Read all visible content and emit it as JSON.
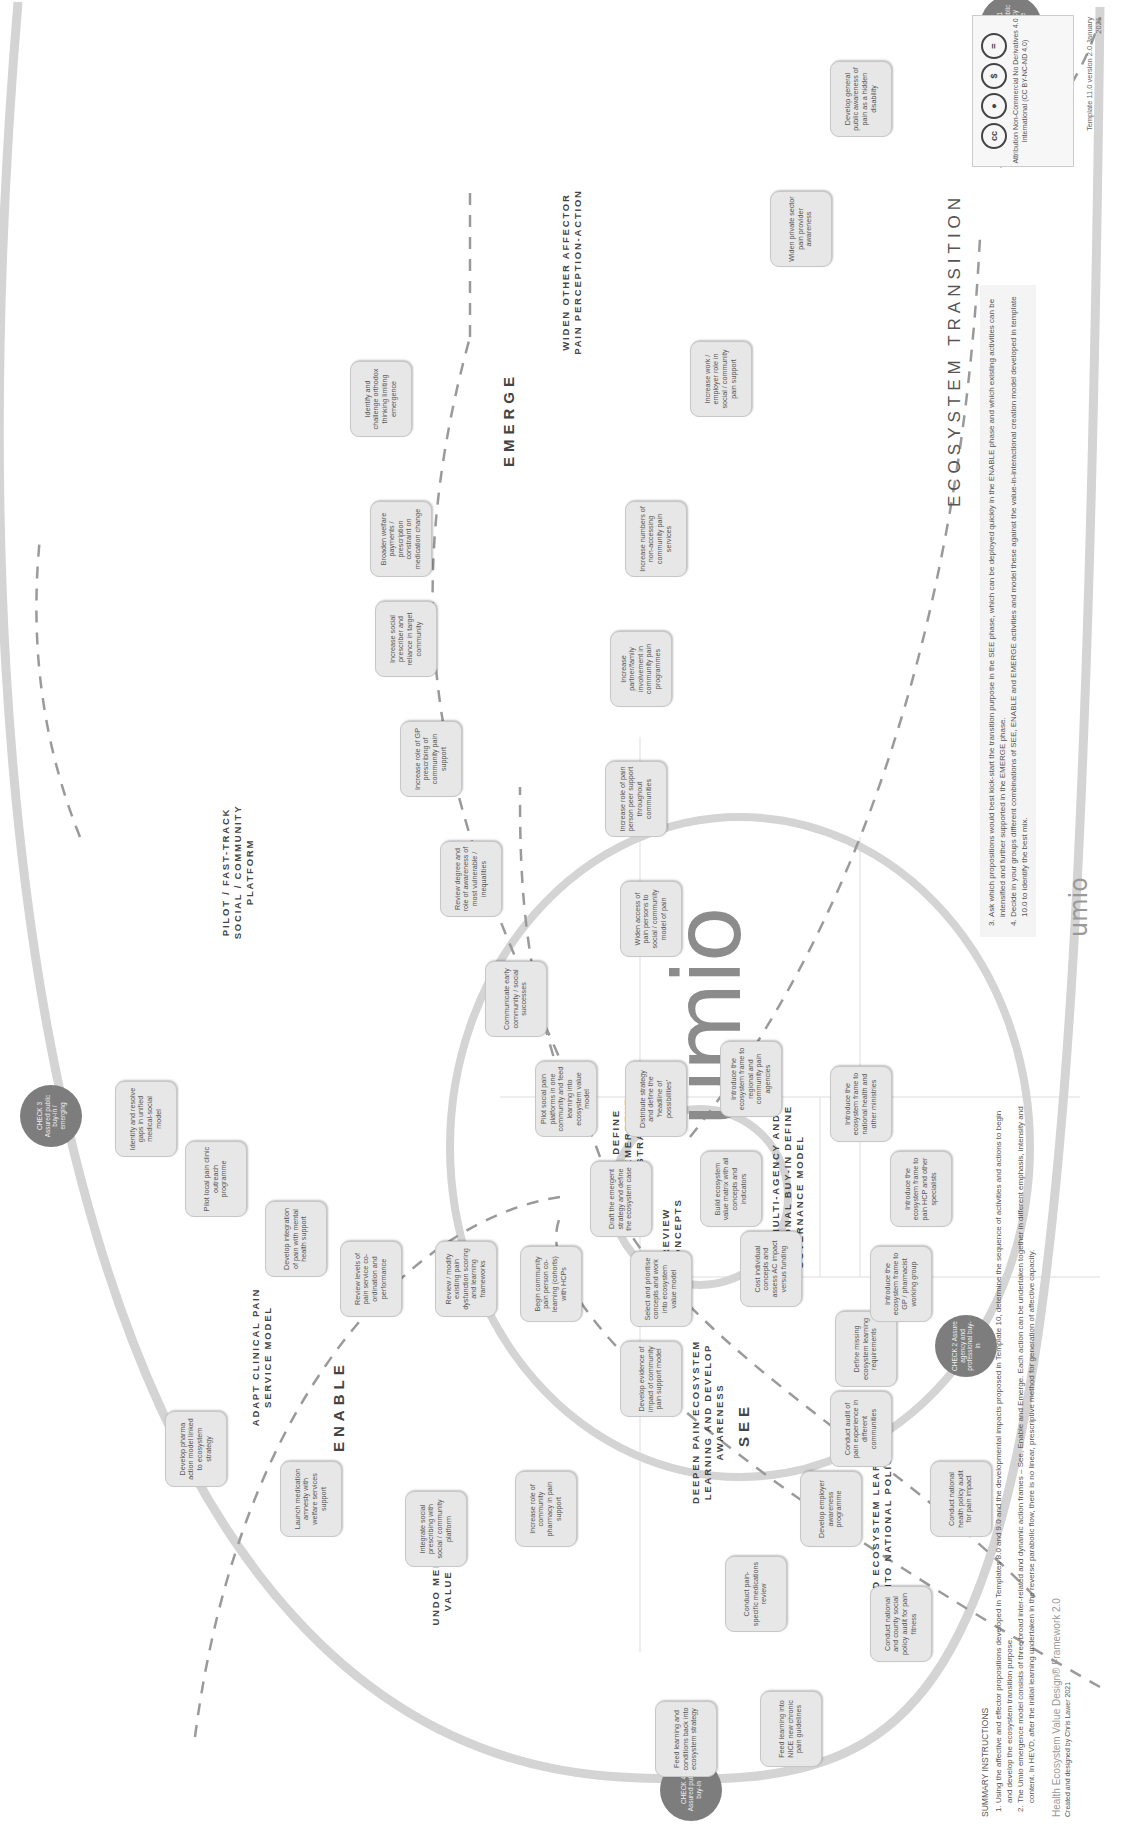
{
  "title": "ECOSYSTEM TRANSITION",
  "logo": "umio",
  "phases": {
    "see": "SEE",
    "enable": "ENABLE",
    "emerge": "EMERGE"
  },
  "sections": {
    "deepen": "DEEPEN PAIN ECOSYSTEM LEARNING AND DEVELOP AWARENESS",
    "feed": "FEED ECOSYSTEM LEARNING INTO NATIONAL POLICY",
    "undo": "UNDO MEDICATION VALUE MODEL",
    "adapt": "ADAPT CLINICAL PAIN SERVICE MODEL",
    "pilot": "PILOT / FAST-TRACK SOCIAL / COMMUNITY PLATFORM",
    "widen": "WIDEN OTHER AFFECTOR PAIN PERCEPTION-ACTION",
    "review": "REVIEW CONCEPTS",
    "define": "DEFINE EMERGENT STRATEGY",
    "create": "CREATE MULTI-AGENCY AND PROFESSIONAL BUY-IN DEFINE GOVERNANCE MODEL"
  },
  "checks": [
    {
      "id": "check-see",
      "label": "CHECK 4 Assured public buy-in"
    },
    {
      "id": "check-enable",
      "label": "CHECK 3 Assured public buy-in / emerging"
    },
    {
      "id": "check-agency",
      "label": "CHECK 2 Assure agency and professional buy-in"
    },
    {
      "id": "check-emerge",
      "label": "CHECK 1 Assured public emergency response"
    }
  ],
  "nodes": {
    "see_outer": [
      "Feed learning into NICE new chronic pain guidelines",
      "Conduct national and county social policy audit for pain fitness",
      "Conduct national health policy audit for pain impact"
    ],
    "see_inner": [
      "Feed learning and conditions back into ecosystem strategy",
      "Conduct pain-specific medications review",
      "Develop employer awareness programme",
      "Conduct audit of pain experience in different communities",
      "Define missing ecosystem learning requirements"
    ],
    "enable_a": [
      "Develop pharma action model linked to ecosystem strategy",
      "Launch medication amnesty with welfare services support"
    ],
    "enable_b": [
      "Integrate social prescribing with social / community platform",
      "Increase role of community pharmacy in pain support",
      "Develop evidence of impact of community pain support model"
    ],
    "adapt": [
      "Identify and resolve gaps in unified medical-social model",
      "Pilot local pain clinic outreach programme",
      "Develop integration of pain with mental health support",
      "Review levels of pain service co-ordination and performance",
      "Review / modify existing pain dysfunction scoring and learning frameworks",
      "Begin community pain person co-learning (cohorts) with HCPs"
    ],
    "pilot": [
      "Pilot social pain platforms in one community and feed learning into ecosystem value model",
      "Communicate early community / social successes",
      "Review degree and role of awareness of most vulnerable / inequalities",
      "Increase role of GP prescribing of community pain support",
      "Increase social prescriber and reliance in target community",
      "Broaden welfare payments / prescription constraint on medication change",
      "Identify and challenge orthodox thinking limiting emergence"
    ],
    "widen": [
      "Widen access of pain persons to social / community model of pain",
      "Increase role of pain person peer support throughout communities",
      "Increase partner/family involvement in community pain programmes",
      "Increase numbers of non-accessing community pain services",
      "Increase work / employer role in social / community pain support",
      "Widen private sector pain provider awareness",
      "Develop general public awareness of pain as a hidden disability"
    ],
    "center": [
      "Select and prioritise concepts and work into ecosystem value model",
      "Draft the emergent strategy and define the ecosystem case",
      "Distribute strategy and define the 'headline of possibilities'",
      "Build ecosystem value matrix with all concepts and indicators",
      "Cost individual concepts and assess AC impact versus funding"
    ],
    "governance": [
      "Introduce the ecosystem frame to regional and community pain agencies",
      "Introduce the ecosystem frame to national health and other ministries",
      "Introduce the ecosystem frame to pain HCP and other specialists",
      "Introduce the ecosystem frame to GP / pharmacist working group"
    ]
  },
  "instructions": {
    "title": "SUMMARY INSTRUCTIONS",
    "items": [
      "Using the affective and effector propositions developed in Templates 8.0 and 9.0 and the developmental impacts proposed in Template 10, determine the sequence of activities and actions to begin and develop the ecosystem transition purpose.",
      "The Umio emergence model consists of three broad inter-related and dynamic action frames – See, Enable and Emerge. Each action can be undertaken together in different emphasis, intensity and content. In HEVD, after the initial learning undertaken in the reverse parabolic flow, there is no linear, prescriptive method for generation of affective capacity.",
      "Ask which propositions would best kick-start the transition purpose in the SEE phase, which can be deployed quickly in the ENABLE phase and which existing activities can be intensified and further supported in the EMERGE phase.",
      "Decide in your groups different combinations of SEE, ENABLE and EMERGE activities and model these against the value-in-interactional creation model developed in template 10.0 to identify the best mix."
    ],
    "numbers": [
      "1.",
      "2.",
      "3.",
      "4."
    ]
  },
  "framework": {
    "name": "Health Ecosystem Value Design® Framework 2.0",
    "credit": "Created and designed by Chris Lawer 2021"
  },
  "license": {
    "text": "Attribution Non-Commercial No Derivatives 4.0 International (CC BY-NC-ND 4.0)",
    "icons": [
      "cc",
      "by",
      "nc",
      "nd"
    ],
    "icon_glyphs": [
      "cc",
      "●",
      "$",
      "="
    ]
  },
  "version": "Template 11.0 version 2.0 January 2021",
  "footer_logo": "umio",
  "colors": {
    "arc": "#d4d4d4",
    "node_bg": "#e7e7e7",
    "check": "#7d7d7d",
    "dash": "#9a9a9a"
  }
}
